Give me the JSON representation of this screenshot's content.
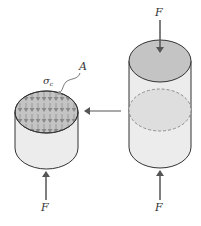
{
  "figure": {
    "type": "diagram",
    "labels": {
      "force_top": "F",
      "force_bottom_left": "F",
      "force_bottom_right": "F",
      "area": "A",
      "stress": "σ",
      "stress_subscript": "c"
    },
    "colors": {
      "outline": "#333333",
      "body_fill": "#ececec",
      "top_fill": "#c4c4c4",
      "section_fill": "#dedede",
      "stress_arrows": "#8a8a8a",
      "arrow": "#555555"
    },
    "elements": {
      "left_cylinder": "Sectioned lower part with cut face area A and stress arrows",
      "right_cylinder": "Full cylinder loaded by F top and bottom with dashed section plane",
      "section_arrow": "Arrow pointing from right cylinder to left (sectioned) part"
    }
  }
}
